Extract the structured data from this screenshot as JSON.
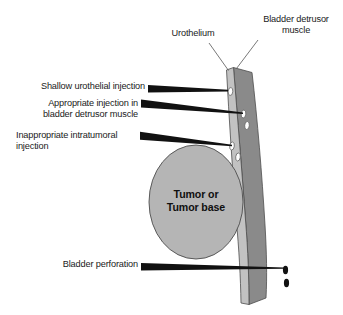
{
  "figure": {
    "background_color": "#ffffff"
  },
  "colors": {
    "urothelium": "#c2c2c2",
    "detrusor": "#8a8a8a",
    "tumor": "#b5b5b5",
    "outline": "#4d4d4d",
    "pointer": "#111111",
    "leader_line": "#555555",
    "depot_fill": "#ffffff",
    "perforation_dot": "#111111",
    "text": "#1a1a1a"
  },
  "labels": {
    "urothelium": "Urothelium",
    "detrusor_muscle": "Bladder detrusor\nmuscle",
    "shallow_injection": "Shallow urothelial injection",
    "appropriate_injection": "Appropriate injection in\nbladder detrusor muscle",
    "inappropriate_injection": "Inappropriate intratumoral\ninjection",
    "bladder_perforation": "Bladder perforation",
    "tumor": "Tumor or\nTumor base"
  },
  "anatomy": {
    "layers": [
      {
        "name": "urothelium",
        "description": "inner light gray mucosal strip"
      },
      {
        "name": "bladder detrusor muscle",
        "description": "outer darker gray muscle band"
      },
      {
        "name": "tumor or tumor base",
        "description": "gray ellipse bulging into lumen"
      }
    ],
    "injection_depots": [
      {
        "name": "shallow urothelial depot",
        "layer": "urothelium",
        "count": 1
      },
      {
        "name": "detrusor depot",
        "layer": "detrusor",
        "count": 2
      },
      {
        "name": "intratumoral depot",
        "layer": "tumor",
        "count": 2
      }
    ],
    "perforation_dots": 2
  }
}
